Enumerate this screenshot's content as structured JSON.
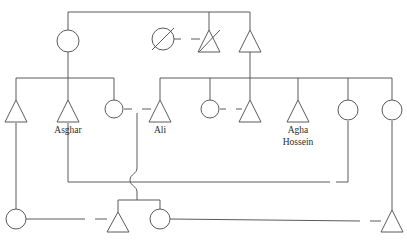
{
  "diagram": {
    "type": "pedigree",
    "stroke_color": "#5a5a5a",
    "text_color": "#2b2b2b",
    "background_color": "#ffffff",
    "symbol_legend": {
      "circle": "female",
      "triangle": "male",
      "slash": "deceased",
      "equals": "marriage-union"
    }
  },
  "labels": [
    {
      "id": "asghar",
      "text": "Asghar",
      "x": 68,
      "y": 133
    },
    {
      "id": "ali",
      "text": "Ali",
      "x": 160,
      "y": 133
    },
    {
      "id": "agha",
      "text": "Agha",
      "x": 298,
      "y": 133
    },
    {
      "id": "hossein",
      "text": "Hossein",
      "x": 298,
      "y": 145
    }
  ],
  "persons": [
    {
      "id": "p-gen1-female",
      "shape": "circle",
      "sex": "female",
      "x": 68,
      "y": 41,
      "deceased": false
    },
    {
      "id": "p-gen1-female-dead",
      "shape": "circle",
      "sex": "female",
      "x": 163,
      "y": 39,
      "deceased": true
    },
    {
      "id": "p-gen1-male-dead",
      "shape": "triangle",
      "sex": "male",
      "x": 209,
      "y": 41,
      "deceased": true
    },
    {
      "id": "p-gen1-male",
      "shape": "triangle",
      "sex": "male",
      "x": 250,
      "y": 41,
      "deceased": false
    },
    {
      "id": "p-gen2-male-left",
      "shape": "triangle",
      "sex": "male",
      "x": 16,
      "y": 111,
      "deceased": false
    },
    {
      "id": "p-asghar",
      "shape": "triangle",
      "sex": "male",
      "x": 68,
      "y": 111,
      "deceased": false
    },
    {
      "id": "p-gen2-female-ali",
      "shape": "circle",
      "sex": "female",
      "x": 114,
      "y": 109,
      "deceased": false
    },
    {
      "id": "p-ali",
      "shape": "triangle",
      "sex": "male",
      "x": 160,
      "y": 111,
      "deceased": false
    },
    {
      "id": "p-gen2-female-mid",
      "shape": "circle",
      "sex": "female",
      "x": 210,
      "y": 109,
      "deceased": false
    },
    {
      "id": "p-gen2-male-mid",
      "shape": "triangle",
      "sex": "male",
      "x": 250,
      "y": 111,
      "deceased": false
    },
    {
      "id": "p-agha-hossein",
      "shape": "triangle",
      "sex": "male",
      "x": 298,
      "y": 111,
      "deceased": false
    },
    {
      "id": "p-gen2-female-r1",
      "shape": "circle",
      "sex": "female",
      "x": 348,
      "y": 109,
      "deceased": false
    },
    {
      "id": "p-gen2-female-r2",
      "shape": "circle",
      "sex": "female",
      "x": 392,
      "y": 109,
      "deceased": false
    },
    {
      "id": "p-gen3-female-left",
      "shape": "circle",
      "sex": "female",
      "x": 16,
      "y": 219,
      "deceased": false
    },
    {
      "id": "p-gen3-male-mid",
      "shape": "triangle",
      "sex": "male",
      "x": 118,
      "y": 221,
      "deceased": false
    },
    {
      "id": "p-gen3-female-mid",
      "shape": "circle",
      "sex": "female",
      "x": 160,
      "y": 219,
      "deceased": false
    },
    {
      "id": "p-gen3-male-right",
      "shape": "triangle",
      "sex": "male",
      "x": 392,
      "y": 221,
      "deceased": false
    }
  ],
  "unions": [
    {
      "id": "u-gen1-dead-pair",
      "x": 186,
      "y": 39
    },
    {
      "id": "u-ali",
      "x": 137,
      "y": 109
    },
    {
      "id": "u-gen2-mid",
      "x": 230,
      "y": 109
    },
    {
      "id": "u-mid-right",
      "x": 332,
      "y": 182
    },
    {
      "id": "u-gen3-left",
      "x": 90,
      "y": 219
    },
    {
      "id": "u-gen3-right",
      "x": 365,
      "y": 221
    }
  ],
  "counts": {
    "persons_total": 17,
    "females": 8,
    "males": 9,
    "deceased": 2,
    "unions": 6,
    "generations": 3
  }
}
